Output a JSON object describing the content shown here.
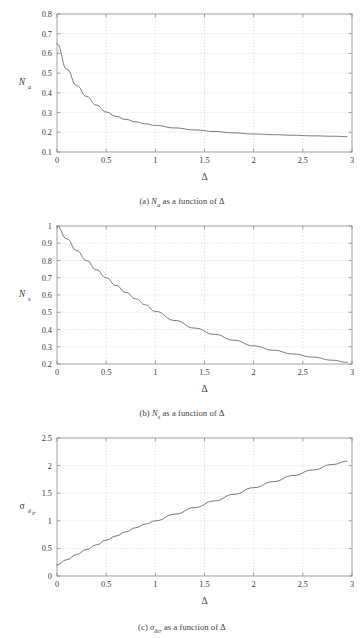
{
  "figure": {
    "background_color": "#ffffff",
    "axis_color": "#8c8c8c",
    "grid_color": "#c8c8c8",
    "curve_color": "#6b6b6b",
    "text_color": "#3c3c3c"
  },
  "subplots": [
    {
      "id": "a",
      "caption_prefix": "(a)",
      "caption_symbol": "N",
      "caption_subscript": "a",
      "caption_suffix": "as a function of Δ",
      "ylabel_symbol": "N",
      "ylabel_subscript": "a",
      "xlabel": "Δ"
    },
    {
      "id": "b",
      "caption_prefix": "(b)",
      "caption_symbol": "N",
      "caption_subscript": "s",
      "caption_suffix": "as a function of Δ",
      "ylabel_symbol": "N",
      "ylabel_subscript": "s",
      "xlabel": "Δ"
    },
    {
      "id": "c",
      "caption_prefix": "(c)",
      "caption_symbol": "σ",
      "caption_subscript": "δtr",
      "caption_suffix": "as a function of Δ",
      "ylabel_symbol": "σ",
      "ylabel_subscript": "δ",
      "ylabel_subscript2": "tr",
      "xlabel": "Δ"
    }
  ],
  "chart_data": [
    {
      "type": "line",
      "title": "(a) N_a as a function of Δ",
      "xlabel": "Δ",
      "ylabel": "N_a",
      "xlim": [
        0,
        3
      ],
      "ylim": [
        0.1,
        0.8
      ],
      "xticks": [
        0,
        0.5,
        1,
        1.5,
        2,
        2.5,
        3
      ],
      "xticklabels": [
        "0",
        "0.5",
        "1",
        "1.5",
        "2",
        "2.5",
        "3"
      ],
      "yticks": [
        0.1,
        0.2,
        0.3,
        0.4,
        0.5,
        0.6,
        0.7,
        0.8
      ],
      "yticklabels": [
        "0.1",
        "0.2",
        "0.3",
        "0.4",
        "0.5",
        "0.6",
        "0.7",
        "0.8"
      ],
      "grid": true,
      "legend": "none",
      "x": [
        0,
        0.1,
        0.2,
        0.3,
        0.4,
        0.5,
        0.6,
        0.7,
        0.8,
        0.9,
        1.0,
        1.2,
        1.4,
        1.6,
        1.8,
        2.0,
        2.2,
        2.4,
        2.6,
        2.8,
        2.95
      ],
      "y": [
        0.65,
        0.52,
        0.437,
        0.382,
        0.338,
        0.303,
        0.281,
        0.265,
        0.253,
        0.243,
        0.235,
        0.222,
        0.212,
        0.204,
        0.197,
        0.191,
        0.188,
        0.185,
        0.182,
        0.18,
        0.178
      ]
    },
    {
      "type": "line",
      "title": "(b) N_s as a function of Δ",
      "xlabel": "Δ",
      "ylabel": "N_s",
      "xlim": [
        0,
        3
      ],
      "ylim": [
        0.2,
        1.0
      ],
      "xticks": [
        0,
        0.5,
        1,
        1.5,
        2,
        2.5,
        3
      ],
      "xticklabels": [
        "0",
        "0.5",
        "1",
        "1.5",
        "2",
        "2.5",
        "3"
      ],
      "yticks": [
        0.2,
        0.3,
        0.4,
        0.5,
        0.6,
        0.7,
        0.8,
        0.9,
        1.0
      ],
      "yticklabels": [
        "0.2",
        "0.3",
        "0.4",
        "0.5",
        "0.6",
        "0.7",
        "0.8",
        "0.9",
        "1"
      ],
      "grid": true,
      "legend": "none",
      "x": [
        0,
        0.1,
        0.2,
        0.3,
        0.4,
        0.5,
        0.6,
        0.7,
        0.8,
        0.9,
        1.0,
        1.2,
        1.4,
        1.6,
        1.8,
        2.0,
        2.2,
        2.4,
        2.6,
        2.8,
        2.95
      ],
      "y": [
        1.0,
        0.925,
        0.858,
        0.8,
        0.747,
        0.7,
        0.655,
        0.615,
        0.578,
        0.543,
        0.505,
        0.452,
        0.408,
        0.372,
        0.338,
        0.305,
        0.28,
        0.258,
        0.24,
        0.222,
        0.21
      ]
    },
    {
      "type": "line",
      "title": "(c) σ_δtr as a function of Δ",
      "xlabel": "Δ",
      "ylabel": "σ_δtr",
      "xlim": [
        0,
        3
      ],
      "ylim": [
        0,
        2.5
      ],
      "xticks": [
        0,
        0.5,
        1,
        1.5,
        2,
        2.5,
        3
      ],
      "xticklabels": [
        "0",
        "0.5",
        "1",
        "1.5",
        "2",
        "2.5",
        "3"
      ],
      "yticks": [
        0,
        0.5,
        1,
        1.5,
        2,
        2.5
      ],
      "yticklabels": [
        "0",
        "0.5",
        "1",
        "1.5",
        "2",
        "2.5"
      ],
      "grid": true,
      "legend": "none",
      "x": [
        0,
        0.1,
        0.2,
        0.3,
        0.4,
        0.5,
        0.6,
        0.7,
        0.8,
        0.9,
        1.0,
        1.2,
        1.4,
        1.6,
        1.8,
        2.0,
        2.2,
        2.4,
        2.6,
        2.8,
        2.95
      ],
      "y": [
        0.2,
        0.295,
        0.39,
        0.48,
        0.565,
        0.65,
        0.725,
        0.8,
        0.875,
        0.94,
        1.0,
        1.12,
        1.24,
        1.36,
        1.48,
        1.6,
        1.71,
        1.82,
        1.92,
        2.02,
        2.08
      ]
    }
  ]
}
